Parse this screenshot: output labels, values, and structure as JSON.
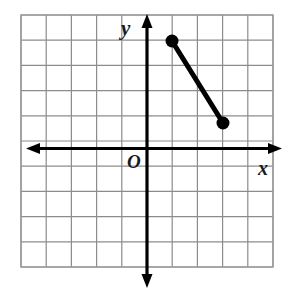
{
  "figure": {
    "type": "coordinate-grid-line-segment",
    "labels": {
      "x_axis": "x",
      "y_axis": "y",
      "origin": "O"
    },
    "colors": {
      "grid": "#8c8c8c",
      "axis": "#000000",
      "segment": "#000000",
      "point": "#000000",
      "background": "#ffffff",
      "border": "#9a9a9a"
    }
  },
  "chart_data": {
    "type": "scatter",
    "title": "",
    "xlabel": "x",
    "ylabel": "y",
    "grid": true,
    "legend": false,
    "xlim": [
      -5,
      5
    ],
    "ylim": [
      -5,
      5
    ],
    "xticks": [
      -5,
      -4,
      -3,
      -2,
      -1,
      0,
      1,
      2,
      3,
      4,
      5
    ],
    "yticks": [
      -5,
      -4,
      -3,
      -2,
      -1,
      0,
      1,
      2,
      3,
      4,
      5
    ],
    "tick_labels_shown": false,
    "series": [
      {
        "name": "segment",
        "kind": "line-segment-with-endpoints",
        "points": [
          {
            "x": 1,
            "y": 4
          },
          {
            "x": 3,
            "y": 1
          }
        ]
      }
    ],
    "annotations": [
      {
        "text": "O",
        "x": -0.45,
        "y": -0.55
      },
      {
        "text": "y",
        "x": -0.55,
        "y": 4.9
      },
      {
        "text": "x",
        "x": 4.5,
        "y": -0.6
      }
    ]
  },
  "geometry": {
    "grid": {
      "left": 21,
      "top": 15,
      "cell": 25.2,
      "cols": 10,
      "rows": 10
    },
    "origin": {
      "x": 147,
      "y": 148.5
    },
    "axes": {
      "x_axis_y": 148.5,
      "y_axis_x": 147,
      "x_start": 30,
      "x_end": 278,
      "y_start": 14,
      "y_end": 288
    },
    "segment": {
      "x1": 172,
      "y1": 41,
      "x2": 223,
      "y2": 123,
      "stroke_width": 5,
      "point_radius": 6.5
    }
  }
}
